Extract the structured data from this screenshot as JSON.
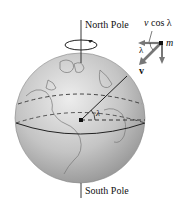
{
  "diagram": {
    "labels": {
      "north_pole": "North Pole",
      "south_pole": "South Pole",
      "v_cos_lambda_v": "v",
      "v_cos_lambda_rest": " cos λ",
      "mass": "m",
      "lambda_small": "λ",
      "velocity": "v",
      "lambda_center": "λ"
    },
    "colors": {
      "globe_light": "#e4e4e4",
      "globe_dark": "#8a8a8a",
      "arrow_gray": "#6f6f6f",
      "line": "#222222"
    }
  }
}
